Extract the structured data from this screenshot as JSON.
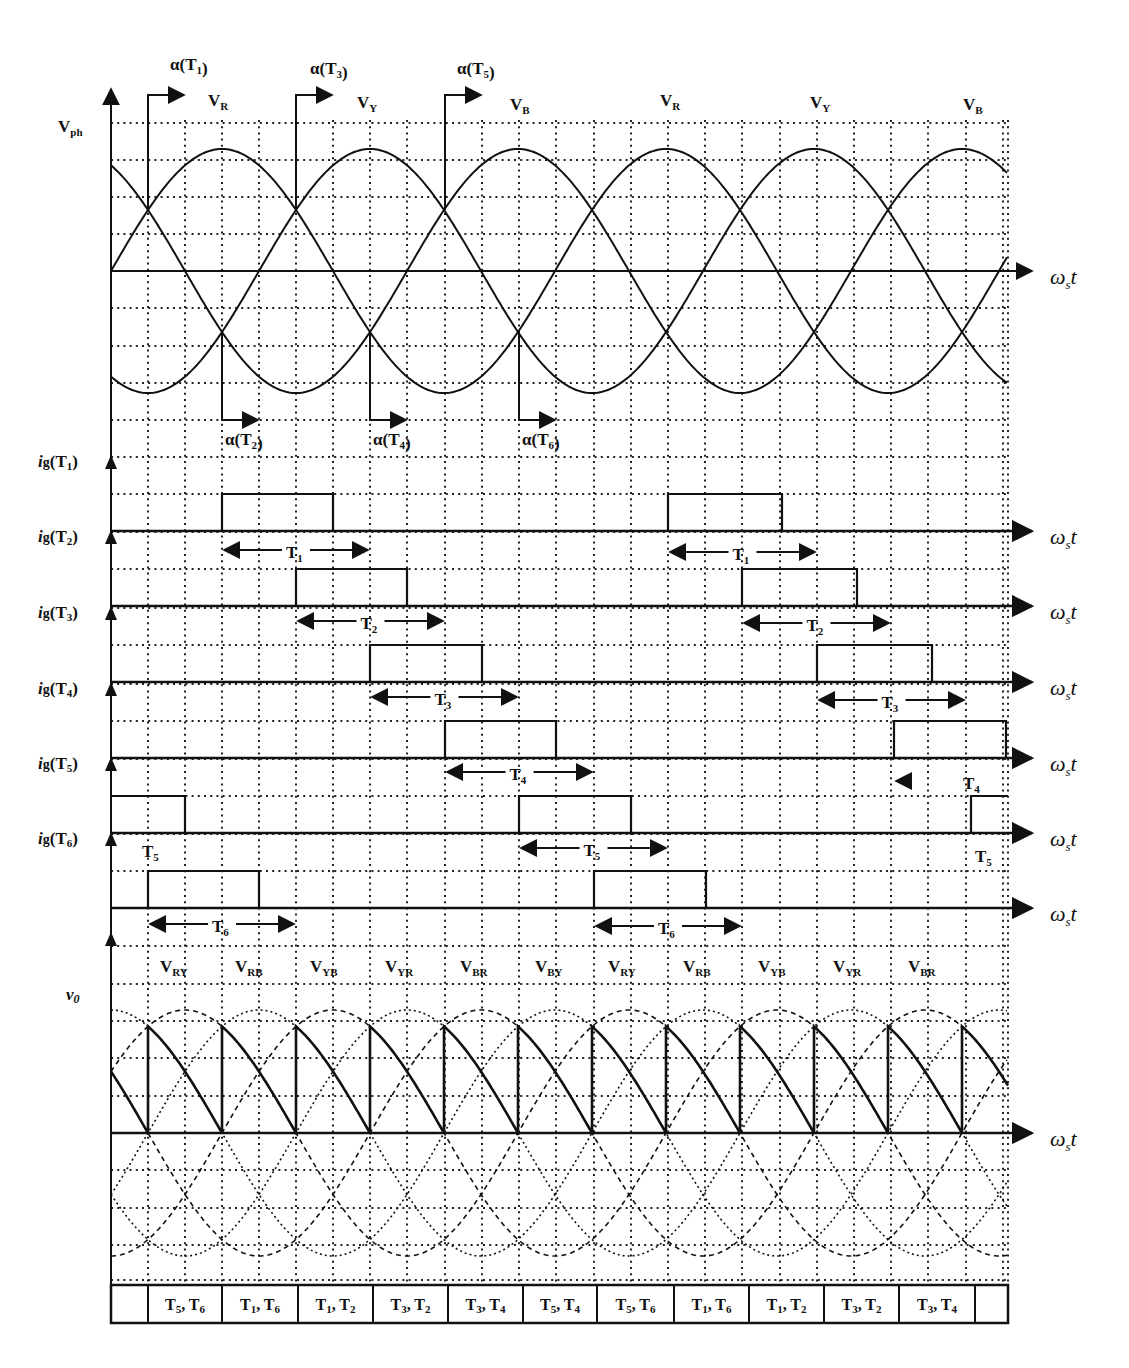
{
  "geometry": {
    "x0": 111,
    "x_end": 1008,
    "deg30_px": 37,
    "grid_x": [
      148,
      185,
      222,
      259,
      296,
      333,
      370,
      407,
      445,
      482,
      519,
      556,
      594,
      631,
      668,
      705,
      742,
      780,
      817,
      854,
      891,
      928,
      966,
      1003
    ],
    "phase_plot": {
      "axis_y": 271,
      "amp": 122,
      "grid_y": [
        123,
        160,
        197,
        234,
        308,
        346,
        383,
        420
      ],
      "top": 95
    },
    "gate_plots": {
      "pulse_height": 37
    },
    "vo_plot": {
      "axis_y": 1133,
      "amp": 123,
      "grid_y": [
        946,
        984,
        1021,
        1058,
        1096,
        1170,
        1208,
        1245,
        1280
      ],
      "top": 930,
      "bottom": 1283
    },
    "table": {
      "top": 1285,
      "bottom": 1323
    }
  },
  "phase_plot": {
    "y_label": "V",
    "y_label_sub": "ph",
    "x_label": "ω",
    "x_label_sub": "s",
    "x_label_t": "t",
    "phase_labels": [
      {
        "text": "V",
        "sub": "R",
        "x": 208,
        "y": 106
      },
      {
        "text": "V",
        "sub": "Y",
        "x": 357,
        "y": 108
      },
      {
        "text": "V",
        "sub": "B",
        "x": 510,
        "y": 110
      },
      {
        "text": "V",
        "sub": "R",
        "x": 660,
        "y": 106
      },
      {
        "text": "V",
        "sub": "Y",
        "x": 810,
        "y": 108
      },
      {
        "text": "V",
        "sub": "B",
        "x": 963,
        "y": 110
      }
    ],
    "firing_top": [
      {
        "text": "α(T",
        "sub": "1",
        "x": 148,
        "label_x": 170,
        "label_y": 70
      },
      {
        "text": "α(T",
        "sub": "3",
        "x": 296,
        "label_x": 310,
        "label_y": 74
      },
      {
        "text": "α(T",
        "sub": "5",
        "x": 445,
        "label_x": 457,
        "label_y": 74
      }
    ],
    "firing_bottom": [
      {
        "text": "α(T",
        "sub": "2",
        "x": 222,
        "label_x": 225,
        "label_y": 445
      },
      {
        "text": "α(T",
        "sub": "4",
        "x": 370,
        "label_x": 373,
        "label_y": 445
      },
      {
        "text": "α(T",
        "sub": "6",
        "x": 519,
        "label_x": 522,
        "label_y": 445
      }
    ]
  },
  "gate_plots": [
    {
      "label": "i",
      "label_g": "g",
      "label_t": "T",
      "label_sub": "1",
      "baseline": 531,
      "pulses": [
        [
          222,
          333
        ],
        [
          668,
          782
        ]
      ],
      "spans": [
        {
          "x1": 222,
          "x2": 370,
          "y": 550,
          "text": "T",
          "sub": "1"
        },
        {
          "x1": 668,
          "x2": 817,
          "y": 552,
          "text": "T",
          "sub": "1"
        }
      ]
    },
    {
      "label": "i",
      "label_g": "g",
      "label_t": "T",
      "label_sub": "2",
      "baseline": 606,
      "pulses": [
        [
          296,
          407
        ],
        [
          742,
          857
        ]
      ],
      "spans": [
        {
          "x1": 296,
          "x2": 445,
          "y": 621,
          "text": "T",
          "sub": "2"
        },
        {
          "x1": 742,
          "x2": 891,
          "y": 623,
          "text": "T",
          "sub": "2"
        }
      ]
    },
    {
      "label": "i",
      "label_g": "g",
      "label_t": "T",
      "label_sub": "3",
      "baseline": 682,
      "pulses": [
        [
          370,
          482
        ],
        [
          817,
          932
        ]
      ],
      "spans": [
        {
          "x1": 370,
          "x2": 519,
          "y": 697,
          "text": "T",
          "sub": "3"
        },
        {
          "x1": 817,
          "x2": 966,
          "y": 700,
          "text": "T",
          "sub": "3"
        }
      ]
    },
    {
      "label": "i",
      "label_g": "g",
      "label_t": "T",
      "label_sub": "4",
      "baseline": 758,
      "pulses": [
        [
          445,
          556
        ],
        [
          894,
          1006
        ]
      ],
      "spans": [
        {
          "x1": 445,
          "x2": 594,
          "y": 772,
          "text": "T",
          "sub": "4"
        },
        {
          "x1": 894,
          "x2": 955,
          "y": 781,
          "text": "T",
          "sub": "4",
          "open_right": true
        }
      ]
    },
    {
      "label": "i",
      "label_g": "g",
      "label_t": "T",
      "label_sub": "5",
      "baseline": 833,
      "pulses": [
        [
          111,
          185
        ],
        [
          519,
          631
        ],
        [
          971,
          1008
        ]
      ],
      "spans": [
        {
          "x1": 519,
          "x2": 668,
          "y": 848,
          "text": "T",
          "sub": "5"
        }
      ],
      "floating_labels": [
        {
          "text": "T",
          "sub": "5",
          "x": 142,
          "y": 857
        },
        {
          "text": "T",
          "sub": "5",
          "x": 975,
          "y": 862
        }
      ]
    },
    {
      "label": "i",
      "label_g": "g",
      "label_t": "T",
      "label_sub": "6",
      "baseline": 908,
      "pulses": [
        [
          148,
          259
        ],
        [
          594,
          706
        ]
      ],
      "spans": [
        {
          "x1": 148,
          "x2": 296,
          "y": 924,
          "text": "T",
          "sub": "6"
        },
        {
          "x1": 594,
          "x2": 742,
          "y": 926,
          "text": "T",
          "sub": "6"
        }
      ]
    }
  ],
  "vo_plot": {
    "y_label": "v",
    "y_label_sub": "0",
    "line_labels": [
      {
        "text": "V",
        "sub": "RY",
        "x": 160
      },
      {
        "text": "V",
        "sub": "RB",
        "x": 235
      },
      {
        "text": "V",
        "sub": "YB",
        "x": 310
      },
      {
        "text": "V",
        "sub": "YR",
        "x": 385
      },
      {
        "text": "V",
        "sub": "BR",
        "x": 460
      },
      {
        "text": "V",
        "sub": "BY",
        "x": 535
      },
      {
        "text": "V",
        "sub": "RY",
        "x": 608
      },
      {
        "text": "V",
        "sub": "RB",
        "x": 683
      },
      {
        "text": "V",
        "sub": "YB",
        "x": 758
      },
      {
        "text": "V",
        "sub": "YR",
        "x": 833
      },
      {
        "text": "V",
        "sub": "BR",
        "x": 908
      }
    ],
    "label_y": 972
  },
  "conduction_table": {
    "cells": [
      {
        "x1": 111,
        "x2": 148,
        "a": "",
        "as": "",
        "b": "",
        "bs": ""
      },
      {
        "x1": 148,
        "x2": 222,
        "a": "T",
        "as": "5",
        "b": "T",
        "bs": "6"
      },
      {
        "x1": 222,
        "x2": 298,
        "a": "T",
        "as": "1",
        "b": "T",
        "bs": "6"
      },
      {
        "x1": 298,
        "x2": 373,
        "a": "T",
        "as": "1",
        "b": "T",
        "bs": "2"
      },
      {
        "x1": 373,
        "x2": 448,
        "a": "T",
        "as": "3",
        "b": "T",
        "bs": "2"
      },
      {
        "x1": 448,
        "x2": 523,
        "a": "T",
        "as": "3",
        "b": "T",
        "bs": "4"
      },
      {
        "x1": 523,
        "x2": 597,
        "a": "T",
        "as": "5",
        "b": "T",
        "bs": "4"
      },
      {
        "x1": 597,
        "x2": 674,
        "a": "T",
        "as": "5",
        "b": "T",
        "bs": "6"
      },
      {
        "x1": 674,
        "x2": 749,
        "a": "T",
        "as": "1",
        "b": "T",
        "bs": "6"
      },
      {
        "x1": 749,
        "x2": 824,
        "a": "T",
        "as": "1",
        "b": "T",
        "bs": "2"
      },
      {
        "x1": 824,
        "x2": 899,
        "a": "T",
        "as": "3",
        "b": "T",
        "bs": "2"
      },
      {
        "x1": 899,
        "x2": 975,
        "a": "T",
        "as": "3",
        "b": "T",
        "bs": "4"
      },
      {
        "x1": 975,
        "x2": 1008,
        "a": "",
        "as": "",
        "b": "",
        "bs": ""
      }
    ]
  },
  "colors": {
    "ink": "#111111",
    "grid": "#222222",
    "bg": "#ffffff"
  }
}
